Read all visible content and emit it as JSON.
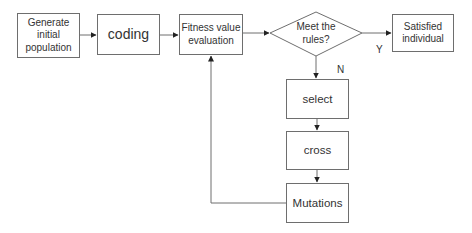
{
  "diagram": {
    "nodes": [
      {
        "id": "generate",
        "label": "Generate initial population",
        "shape": "rect"
      },
      {
        "id": "coding",
        "label": "coding",
        "shape": "rect"
      },
      {
        "id": "fitness",
        "label": "Fitness value evaluation",
        "shape": "rect"
      },
      {
        "id": "decision",
        "label": "Meet the rules?",
        "shape": "diamond"
      },
      {
        "id": "satisfied",
        "label": "Satisfied individual",
        "shape": "rect"
      },
      {
        "id": "select",
        "label": "select",
        "shape": "rect"
      },
      {
        "id": "cross",
        "label": "cross",
        "shape": "rect"
      },
      {
        "id": "mutations",
        "label": "Mutations",
        "shape": "rect"
      }
    ],
    "edges": [
      {
        "from": "generate",
        "to": "coding",
        "label": ""
      },
      {
        "from": "coding",
        "to": "fitness",
        "label": ""
      },
      {
        "from": "fitness",
        "to": "decision",
        "label": ""
      },
      {
        "from": "decision",
        "to": "satisfied",
        "label": "Y"
      },
      {
        "from": "decision",
        "to": "select",
        "label": "N"
      },
      {
        "from": "select",
        "to": "cross",
        "label": ""
      },
      {
        "from": "cross",
        "to": "mutations",
        "label": ""
      },
      {
        "from": "mutations",
        "to": "fitness",
        "label": ""
      }
    ],
    "labels": {
      "generate_l1": "Generate",
      "generate_l2": "initial",
      "generate_l3": "population",
      "coding": "coding",
      "fitness_l1": "Fitness value",
      "fitness_l2": "evaluation",
      "decision_l1": "Meet the",
      "decision_l2": "rules?",
      "satisfied_l1": "Satisfied",
      "satisfied_l2": "individual",
      "select": "select",
      "cross": "cross",
      "mutations": "Mutations",
      "yes": "Y",
      "no": "N"
    }
  }
}
